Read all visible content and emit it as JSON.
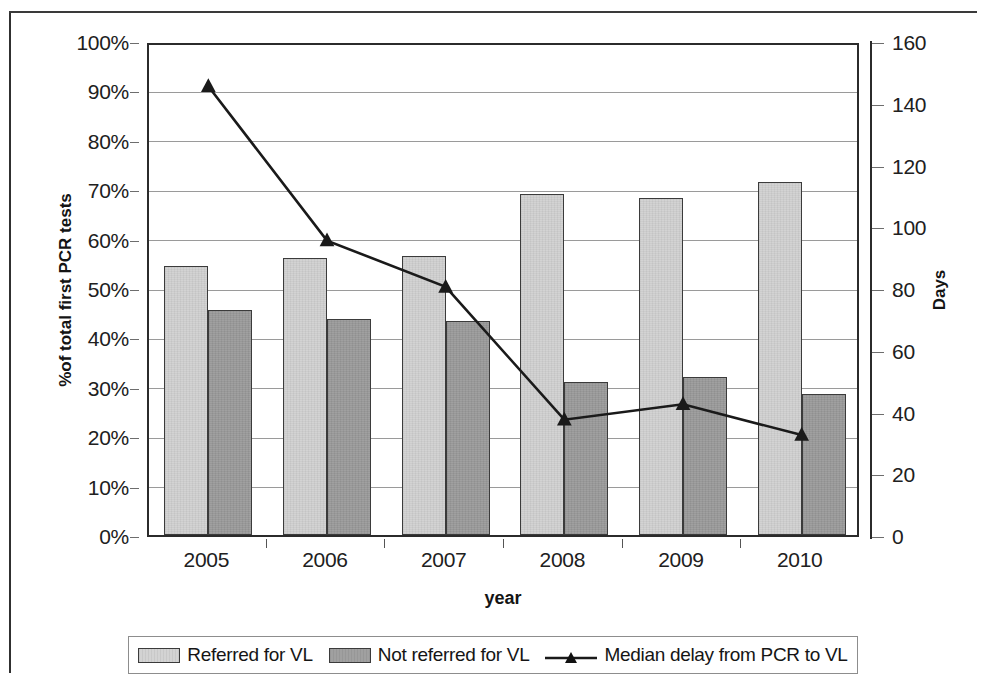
{
  "chart_data": {
    "type": "bar",
    "title": "",
    "subtitle": "",
    "xlabel": "year",
    "ylabel": "%of total first PCR tests",
    "y2label": "Days",
    "categories": [
      "2005",
      "2006",
      "2007",
      "2008",
      "2009",
      "2010"
    ],
    "ylim": [
      0,
      100
    ],
    "ylim_right": [
      0,
      160
    ],
    "ytick_labels": [
      "100%",
      "90%",
      "80%",
      "70%",
      "60%",
      "50%",
      "40%",
      "30%",
      "20%",
      "10%",
      "0%"
    ],
    "ytick_values": [
      100,
      90,
      80,
      70,
      60,
      50,
      40,
      30,
      20,
      10,
      0
    ],
    "ytick_right_labels": [
      "160",
      "140",
      "120",
      "100",
      "80",
      "60",
      "40",
      "20",
      "0"
    ],
    "ytick_right_values": [
      160,
      140,
      120,
      100,
      80,
      60,
      40,
      20,
      0
    ],
    "grid": true,
    "legend_position": "bottom",
    "series": [
      {
        "name": "Referred for VL",
        "type": "bar",
        "axis": "left",
        "color": "#d3d3d3",
        "values": [
          54.4,
          56.1,
          56.5,
          69.1,
          68.2,
          71.4
        ]
      },
      {
        "name": "Not referred for VL",
        "type": "bar",
        "axis": "left",
        "color": "#a0a0a0",
        "values": [
          45.5,
          43.7,
          43.4,
          30.9,
          32.0,
          28.6
        ]
      },
      {
        "name": "Median delay from PCR to VL",
        "type": "line",
        "axis": "right",
        "color": "#1a1a1a",
        "marker": "triangle",
        "values": [
          146,
          96,
          81,
          38,
          43,
          33
        ]
      }
    ]
  },
  "legend": {
    "items": [
      {
        "label": "Referred for VL",
        "marker": "bar-swatch-light"
      },
      {
        "label": "Not referred for VL",
        "marker": "bar-swatch-dark"
      },
      {
        "label": "Median delay from PCR to VL",
        "marker": "line-triangle-marker"
      }
    ]
  },
  "colors": {
    "bar_light": "#d3d3d3",
    "bar_dark": "#a0a0a0",
    "line": "#1a1a1a",
    "gridline": "#9a9a9a",
    "axis": "#2b2b2b",
    "background": "#ffffff"
  }
}
